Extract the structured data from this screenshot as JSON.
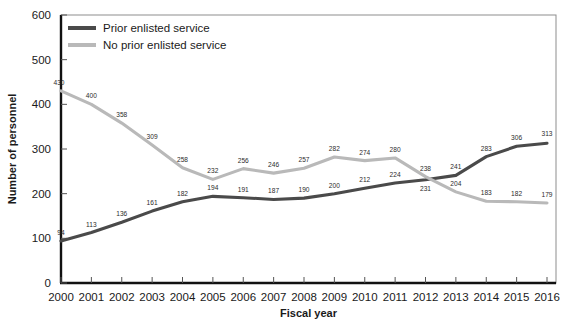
{
  "chart_data": {
    "type": "line",
    "title": "",
    "xlabel": "Fiscal year",
    "ylabel": "Number of personnel",
    "categories": [
      "2000",
      "2001",
      "2002",
      "2003",
      "2004",
      "2005",
      "2006",
      "2007",
      "2008",
      "2009",
      "2010",
      "2011",
      "2012",
      "2013",
      "2014",
      "2015",
      "2016"
    ],
    "ylim": [
      0,
      600
    ],
    "yticks": [
      0,
      100,
      200,
      300,
      400,
      500,
      600
    ],
    "grid": false,
    "legend_position": "top-left",
    "series": [
      {
        "name": "Prior enlisted service",
        "color": "#4a4a4a",
        "values": [
          94,
          113,
          136,
          161,
          182,
          194,
          191,
          187,
          190,
          200,
          212,
          224,
          231,
          241,
          283,
          306,
          313
        ]
      },
      {
        "name": "No prior enlisted service",
        "color": "#b9b9b9",
        "values": [
          430,
          400,
          358,
          309,
          258,
          232,
          256,
          246,
          257,
          282,
          274,
          280,
          238,
          204,
          183,
          182,
          179
        ]
      }
    ]
  }
}
